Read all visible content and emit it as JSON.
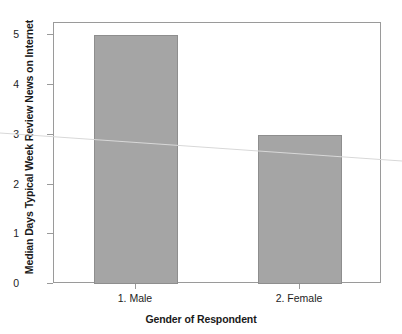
{
  "chart_data": {
    "type": "bar",
    "title": "",
    "xlabel": "Gender of Respondent",
    "ylabel": "Median Days Typical Week Review News on Internet",
    "categories": [
      "1. Male",
      "2. Female"
    ],
    "values": [
      5,
      3
    ],
    "ylim": [
      0,
      5.25
    ],
    "y_ticks": [
      "0",
      "1",
      "2",
      "3",
      "4",
      "5"
    ],
    "y_tick_values": [
      0,
      1,
      2,
      3,
      4,
      5
    ],
    "grid": false,
    "legend": null,
    "bar_color": "#a5a5a5",
    "bar_border_color": "#8e8e8e",
    "frame_color": "#9a9a9a",
    "background": "#ffffff"
  },
  "axes": {
    "y_title": "Median Days Typical Week Review News on Internet",
    "x_title": "Gender of Respondent",
    "y_ticks": [
      {
        "label": "5",
        "value": 5
      },
      {
        "label": "4",
        "value": 4
      },
      {
        "label": "3",
        "value": 3
      },
      {
        "label": "2",
        "value": 2
      },
      {
        "label": "1",
        "value": 1
      },
      {
        "label": "0",
        "value": 0
      }
    ],
    "x_ticks": [
      {
        "label": "1. Male"
      },
      {
        "label": "2. Female"
      }
    ]
  },
  "bars": [
    {
      "category": "1. Male",
      "value": 5
    },
    {
      "category": "2. Female",
      "value": 3
    }
  ]
}
